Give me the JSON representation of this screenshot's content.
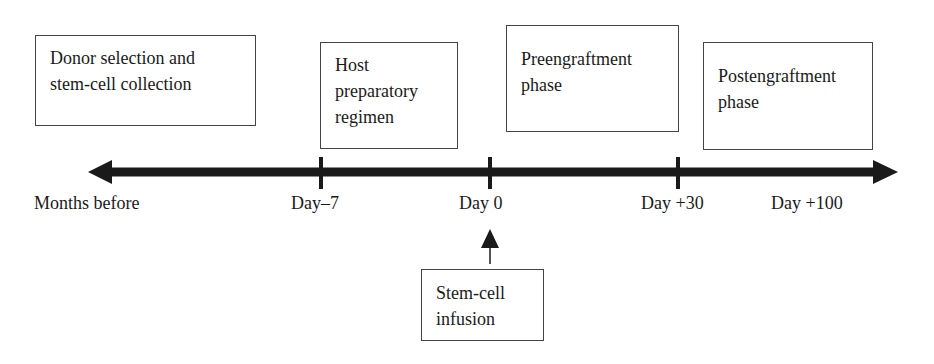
{
  "phases": [
    {
      "label_line1": "Donor selection and",
      "label_line2": "stem-cell collection"
    },
    {
      "label_line1": "Host",
      "label_line2": "preparatory",
      "label_line3": "regimen"
    },
    {
      "label_line1": "Preengraftment",
      "label_line2": "phase"
    },
    {
      "label_line1": "Postengraftment",
      "label_line2": "phase"
    }
  ],
  "timeline": {
    "labels": [
      "Months before",
      "Day–7",
      "Day 0",
      "Day +30",
      "Day +100"
    ]
  },
  "event": {
    "label_line1": "Stem-cell",
    "label_line2": "infusion"
  }
}
